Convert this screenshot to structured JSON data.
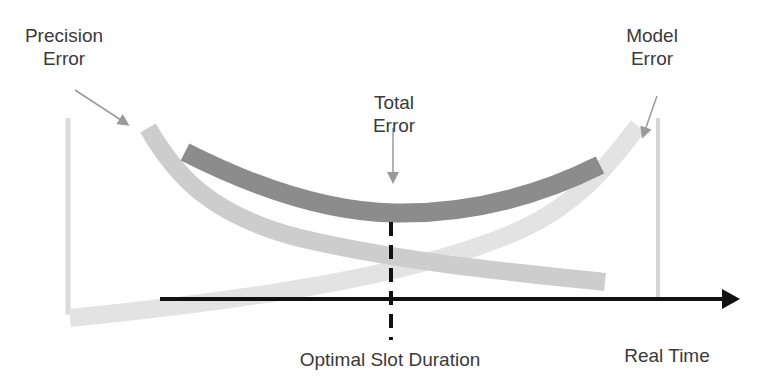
{
  "diagram": {
    "labels": {
      "precision_error": [
        "Precision",
        "Error"
      ],
      "model_error": [
        "Model",
        "Error"
      ],
      "total_error": [
        "Total",
        "Error"
      ],
      "optimal_slot_duration": "Optimal Slot Duration",
      "real_time": "Real Time"
    },
    "curves": [
      {
        "name": "Precision Error",
        "shape": "decreasing",
        "color": "#cccccc"
      },
      {
        "name": "Model Error",
        "shape": "increasing",
        "color": "#e2e2e2"
      },
      {
        "name": "Total Error",
        "shape": "u-shaped",
        "color": "#8c8c8c"
      }
    ],
    "x_axis": {
      "label": "Real Time",
      "color": "#111111"
    },
    "marker": {
      "label": "Optimal Slot Duration",
      "style": "dashed",
      "color": "#111111"
    },
    "colors": {
      "text": "#3a3a3a",
      "axis": "#111111",
      "total_error": "#8c8c8c",
      "precision_error": "#cccccc",
      "model_error": "#e2e2e2",
      "pointer_arrows": "#9a9a9a"
    }
  }
}
